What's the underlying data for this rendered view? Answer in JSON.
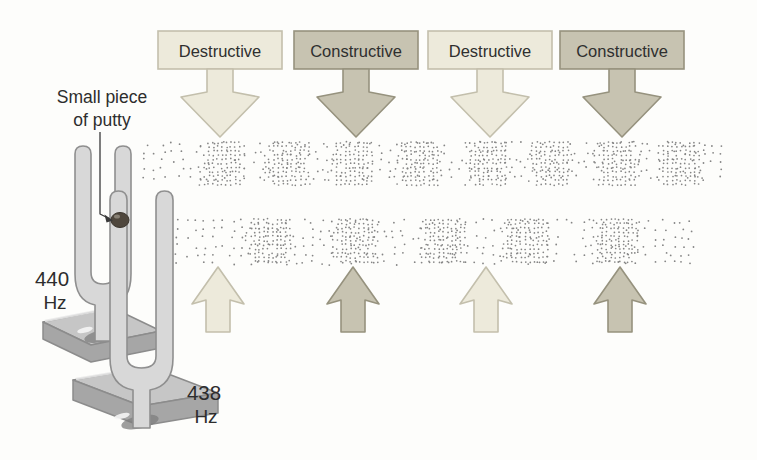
{
  "figure_type": "physics-beats-diagram",
  "labels": {
    "putty_line1": "Small piece",
    "putty_line2": "of putty",
    "fork_front_freq": "440",
    "fork_front_unit": "Hz",
    "fork_back_freq": "438",
    "fork_back_unit": "Hz"
  },
  "interference_top": [
    {
      "label": "Destructive",
      "type": "destructive",
      "cx": 220
    },
    {
      "label": "Constructive",
      "type": "constructive",
      "cx": 356
    },
    {
      "label": "Destructive",
      "type": "destructive",
      "cx": 490
    },
    {
      "label": "Constructive",
      "type": "constructive",
      "cx": 622
    }
  ],
  "bottom_arrows": [
    {
      "type": "destructive",
      "cx": 218
    },
    {
      "type": "constructive",
      "cx": 353
    },
    {
      "type": "destructive",
      "cx": 486
    },
    {
      "type": "constructive",
      "cx": 620
    }
  ],
  "wave_bands": {
    "upper": {
      "source": "440 Hz fork",
      "x0": 145,
      "x1": 723,
      "y0": 141,
      "y1": 187,
      "condensation_centers": [
        223,
        288,
        351,
        421,
        489,
        551,
        618,
        682
      ],
      "cluster_halfwidth": 23
    },
    "lower": {
      "source": "438 Hz fork",
      "x0": 178,
      "x1": 695,
      "y0": 218,
      "y1": 265,
      "condensation_centers": [
        270,
        357,
        445,
        527,
        617
      ],
      "cluster_halfwidth": 24
    }
  },
  "colors": {
    "destructive": {
      "fill": "#edeadb",
      "stroke": "#c3bfac"
    },
    "constructive": {
      "fill": "#c7c3b1",
      "stroke": "#96927e"
    },
    "text": "#2f2f2f",
    "dot": "#858585",
    "fork_fill": "#d8d8d8",
    "fork_stroke": "#8f8f8f",
    "base_top": "#c6c6c6",
    "base_front": "#a6a6a6",
    "base_stroke": "#8c8c8c",
    "putty": "#4f473d",
    "label_text": "#2d2d2d"
  }
}
